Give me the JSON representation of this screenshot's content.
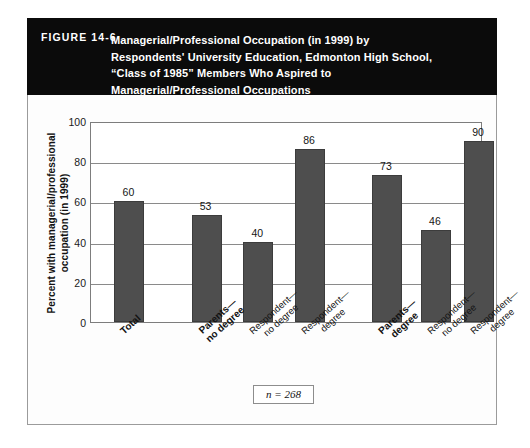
{
  "figure": {
    "number_label": "FIGURE 14-6",
    "title_lines": [
      "Managerial/Professional Occupation (in 1999) by",
      "Respondents' University Education, Edmonton High School,",
      "“Class of 1985” Members Who Aspired to",
      "Managerial/Professional Occupations"
    ],
    "title_text": "Managerial/Professional Occupation (in 1999) by Respondents' University Education, Edmonton High School, “Class of 1985” Members Who Aspired to Managerial/Professional Occupations",
    "sample_note": "n = 268",
    "banner_color": "#0b0b0b",
    "bar_color": "#4e4e4e"
  },
  "chart_data": {
    "type": "bar",
    "xlabel": "",
    "ylabel": "Percent with managerial/professional occupation (in 1999)",
    "ylim": [
      0,
      100
    ],
    "yticks": [
      0,
      20,
      40,
      60,
      80,
      100
    ],
    "ytick_labels": [
      "0",
      "20",
      "40",
      "60",
      "80",
      "100"
    ],
    "grid": true,
    "legend": false,
    "annotations": [
      "n = 268"
    ],
    "categories": [
      "Total",
      "Parents— no degree",
      "Respondent— no degree",
      "Respondent— degree",
      "Parents— degree",
      "Respondent— no degree",
      "Respondent— degree"
    ],
    "values": [
      60,
      53,
      40,
      86,
      73,
      46,
      90
    ],
    "bars": [
      {
        "label_line1": "Total",
        "label_line2": "",
        "value": 60,
        "bold": true,
        "x_center_pct": 9.8,
        "group": 1
      },
      {
        "label_line1": "Parents—",
        "label_line2": "no degree",
        "value": 53,
        "bold": true,
        "x_center_pct": 29.5,
        "group": 1
      },
      {
        "label_line1": "Respondent—",
        "label_line2": "no degree",
        "value": 40,
        "bold": false,
        "x_center_pct": 42.7,
        "group": 1
      },
      {
        "label_line1": "Respondent—",
        "label_line2": "degree",
        "value": 86,
        "bold": false,
        "x_center_pct": 55.9,
        "group": 1
      },
      {
        "label_line1": "Parents—",
        "label_line2": "degree",
        "value": 73,
        "bold": true,
        "x_center_pct": 75.5,
        "group": 2
      },
      {
        "label_line1": "Respondent—",
        "label_line2": "no degree",
        "value": 46,
        "bold": false,
        "x_center_pct": 88.0,
        "group": 2
      },
      {
        "label_line1": "Respondent—",
        "label_line2": "degree",
        "value": 90,
        "bold": false,
        "x_center_pct": 99.0,
        "group": 2
      }
    ]
  }
}
